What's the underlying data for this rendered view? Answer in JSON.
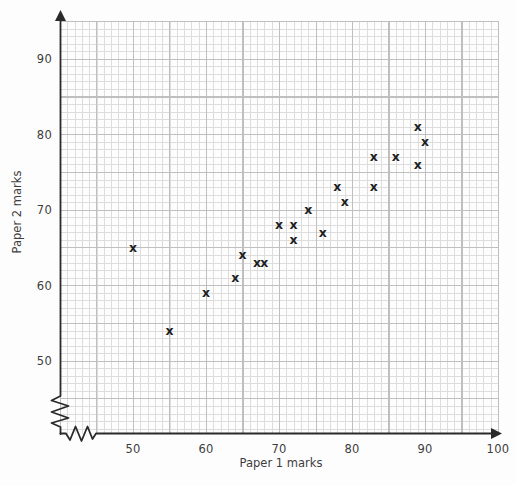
{
  "figure": {
    "x_axis_title": "Paper 1 marks",
    "y_axis_title": "Paper 2 marks"
  },
  "chart_data": {
    "type": "scatter",
    "title": "",
    "xlabel": "Paper 1 marks",
    "ylabel": "Paper 2 marks",
    "x_ticks": [
      50,
      60,
      70,
      80,
      90,
      100
    ],
    "y_ticks": [
      50,
      60,
      70,
      80,
      90
    ],
    "xlim": [
      45,
      100
    ],
    "ylim": [
      45,
      95
    ],
    "axis_break_x": true,
    "axis_break_y": true,
    "grid": "graph-paper, minor line every 1 mark, major line every 5 marks",
    "legend": "none",
    "marker": "x",
    "points": [
      [
        50,
        65
      ],
      [
        55,
        54
      ],
      [
        60,
        59
      ],
      [
        64,
        61
      ],
      [
        65,
        64
      ],
      [
        67,
        63
      ],
      [
        68,
        63
      ],
      [
        70,
        68
      ],
      [
        72,
        66
      ],
      [
        72,
        68
      ],
      [
        74,
        70
      ],
      [
        76,
        67
      ],
      [
        78,
        73
      ],
      [
        79,
        71
      ],
      [
        83,
        73
      ],
      [
        83,
        77
      ],
      [
        86,
        77
      ],
      [
        89,
        76
      ],
      [
        89,
        81
      ],
      [
        90,
        79
      ]
    ]
  },
  "colors": {
    "axis": "#2a2a2a",
    "marker": "#1f1f1f",
    "grid_minor": "#dddddd",
    "grid_major": "#bfbfbf",
    "label_text": "#3d3d3d",
    "background": "#fdfdfd"
  }
}
